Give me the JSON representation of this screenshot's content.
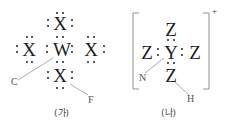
{
  "diagrams": [
    {
      "id": "ga",
      "caption": "(가)",
      "center_atom": "W",
      "outer_atoms": [
        "X",
        "X",
        "X",
        "X"
      ],
      "pointer_labels": {
        "left": "C",
        "right": "F"
      }
    },
    {
      "id": "na",
      "caption": "(나)",
      "center_atom": "Y",
      "outer_atoms": [
        "Z",
        "Z",
        "Z",
        "Z"
      ],
      "charge": "+",
      "pointer_labels": {
        "left": "N",
        "right": "H"
      }
    }
  ]
}
